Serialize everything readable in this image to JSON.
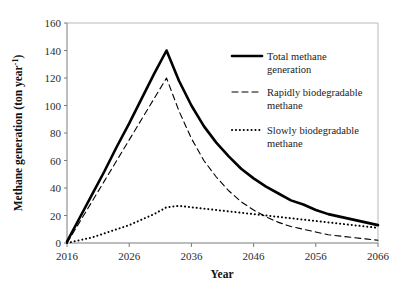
{
  "chart_data": {
    "type": "line",
    "title": "",
    "xlabel": "Year",
    "ylabel": "Methane generation (ton year-1)",
    "ylabel_main": "Methane generation (ton year",
    "ylabel_sup": "-1",
    "ylabel_tail": ")",
    "xlim": [
      2016,
      2066
    ],
    "ylim": [
      0,
      160
    ],
    "xticks": [
      2016,
      2026,
      2036,
      2046,
      2056,
      2066
    ],
    "yticks": [
      0,
      20,
      40,
      60,
      80,
      100,
      120,
      140,
      160
    ],
    "grid": false,
    "legend_position": "right-inside",
    "x": [
      2016,
      2018,
      2020,
      2022,
      2024,
      2026,
      2028,
      2030,
      2032,
      2034,
      2036,
      2038,
      2040,
      2042,
      2044,
      2046,
      2048,
      2050,
      2052,
      2054,
      2056,
      2058,
      2060,
      2062,
      2064,
      2066
    ],
    "series": [
      {
        "name": "Total methane generation",
        "style": "solid",
        "color": "#000000",
        "width": 2.6,
        "values": [
          1,
          18,
          35,
          52,
          70,
          87,
          105,
          123,
          140,
          118,
          100,
          85,
          73,
          63,
          54,
          47,
          41,
          36,
          31,
          28,
          24,
          21,
          19,
          17,
          15,
          13
        ]
      },
      {
        "name": "Rapidly biodegradable methane",
        "style": "dashed",
        "color": "#000000",
        "width": 1.1,
        "values": [
          0,
          15,
          30,
          45,
          60,
          75,
          90,
          105,
          120,
          96,
          76,
          60,
          48,
          38,
          30,
          24,
          19,
          15,
          12,
          10,
          8,
          6,
          5,
          4,
          3,
          2
        ]
      },
      {
        "name": "Slowly biodegradable methane",
        "style": "dotted",
        "color": "#000000",
        "width": 2.0,
        "values": [
          0,
          2,
          4,
          7,
          10,
          13,
          17,
          21,
          26,
          27,
          26,
          25,
          24,
          23,
          22,
          21,
          20,
          19,
          18,
          17,
          16,
          15,
          14,
          13,
          12,
          11
        ]
      }
    ],
    "legend": [
      {
        "label_line1": "Total methane",
        "label_line2": "generation",
        "style": "solid"
      },
      {
        "label_line1": "Rapidly biodegradable",
        "label_line2": "methane",
        "style": "dashed"
      },
      {
        "label_line1": "Slowly biodegradable",
        "label_line2": "methane",
        "style": "dotted"
      }
    ]
  }
}
